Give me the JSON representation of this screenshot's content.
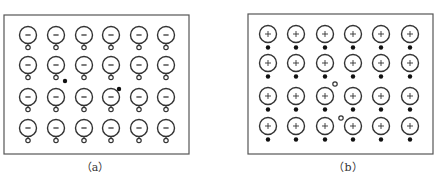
{
  "panels": [
    {
      "id": "a",
      "caption": "（a）",
      "caption_x": 95,
      "box": {
        "x": 4,
        "y": 15,
        "w": 185,
        "h": 139
      },
      "ion_sign": "−",
      "ion_type": "negative",
      "carrier_below": "hole",
      "cols": [
        28,
        56,
        84,
        111,
        139,
        166
      ],
      "rows": [
        35,
        65,
        97,
        128
      ],
      "free_carriers": [
        {
          "type": "electron",
          "x": 65,
          "y": 81
        },
        {
          "type": "electron",
          "x": 119,
          "y": 89
        }
      ]
    },
    {
      "id": "b",
      "caption": "（b）",
      "caption_x": 348,
      "box": {
        "x": 248,
        "y": 14,
        "w": 185,
        "h": 140
      },
      "ion_sign": "+",
      "ion_type": "positive",
      "carrier_below": "electron",
      "cols": [
        268,
        296,
        325,
        353,
        381,
        410
      ],
      "rows": [
        34,
        63,
        96,
        126
      ],
      "free_carriers": [
        {
          "type": "hole",
          "x": 335,
          "y": 84
        },
        {
          "type": "hole",
          "x": 341,
          "y": 118
        }
      ]
    }
  ],
  "colors": {
    "stroke": "#333333",
    "box": "#555555",
    "fill": "#ffffff"
  }
}
